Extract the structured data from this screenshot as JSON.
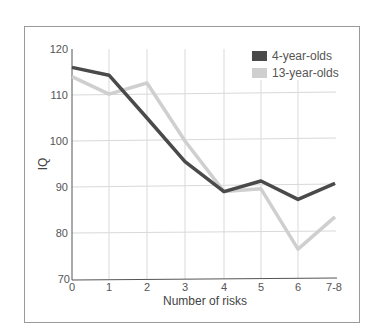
{
  "chart_data": {
    "type": "line",
    "title": "",
    "xlabel": "Number of risks",
    "ylabel": "IQ",
    "categories": [
      "0",
      "1",
      "2",
      "3",
      "4",
      "5",
      "6",
      "7-8"
    ],
    "ylim": [
      70,
      120
    ],
    "yticks": [
      70,
      80,
      90,
      100,
      110,
      120
    ],
    "grid": true,
    "legend_position": "top-right",
    "series": [
      {
        "name": "4-year-olds",
        "color": "#4a4a4a",
        "values": [
          116,
          114.3,
          105,
          95.5,
          89,
          91.3,
          87.3,
          90.8
        ]
      },
      {
        "name": "13-year-olds",
        "color": "#cfcfcf",
        "values": [
          114,
          110.2,
          112.6,
          100,
          89,
          89.6,
          76.5,
          83.5
        ]
      }
    ]
  },
  "legend": {
    "items": [
      {
        "label": "4-year-olds",
        "color": "#4a4a4a"
      },
      {
        "label": "13-year-olds",
        "color": "#cfcfcf"
      }
    ]
  },
  "axes": {
    "x_title": "Number of risks",
    "y_title": "IQ",
    "x_ticks": [
      "0",
      "1",
      "2",
      "3",
      "4",
      "5",
      "6",
      "7-8"
    ],
    "y_ticks": [
      "120",
      "110",
      "100",
      "90",
      "80",
      "70"
    ]
  }
}
